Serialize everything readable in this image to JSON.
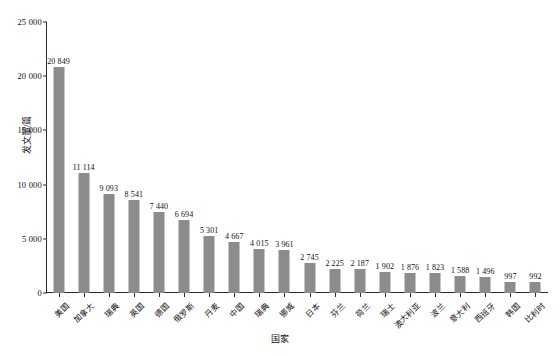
{
  "chart_data": {
    "type": "bar",
    "title": "",
    "xlabel": "国家",
    "ylabel": "发文量/篇",
    "ylim": [
      0,
      25000
    ],
    "yticks": [
      0,
      5000,
      10000,
      15000,
      20000,
      25000
    ],
    "ytick_labels": [
      "0",
      "5 000",
      "10 000",
      "15 000",
      "20 000",
      "25 000"
    ],
    "grid": false,
    "legend": null,
    "bar_color": "#8c8c8c",
    "axis_color": "#2b2b2b",
    "categories": [
      "美国",
      "加拿大",
      "瑞典",
      "英国",
      "德国",
      "俄罗斯",
      "丹麦",
      "中国",
      "瑞典",
      "挪威",
      "日本",
      "芬兰",
      "荷兰",
      "瑞士",
      "澳大利亚",
      "波兰",
      "意大利",
      "西班牙",
      "韩国",
      "比利时"
    ],
    "values": [
      20849,
      11114,
      9093,
      8541,
      7440,
      6694,
      5301,
      4667,
      4015,
      3961,
      2745,
      2225,
      2187,
      1902,
      1876,
      1823,
      1588,
      1496,
      997,
      992
    ],
    "value_labels": [
      "20 849",
      "11 114",
      "9 093",
      "8 541",
      "7 440",
      "6 694",
      "5 301",
      "4 667",
      "4 015",
      "3 961",
      "2 745",
      "2 225",
      "2 187",
      "1 902",
      "1 876",
      "1 823",
      "1 588",
      "1 496",
      "997",
      "992"
    ],
    "caption": ""
  }
}
